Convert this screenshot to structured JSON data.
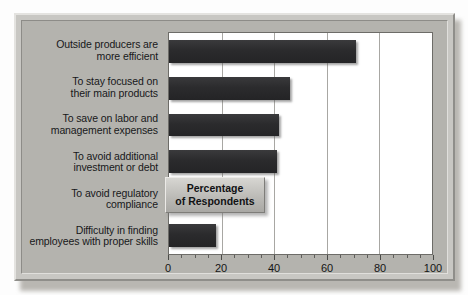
{
  "chart_data": {
    "type": "bar",
    "orientation": "horizontal",
    "title": "",
    "xlabel": "Percentage of Respondents",
    "ylabel": "",
    "xlim": [
      0,
      100
    ],
    "grid": true,
    "legend_position": "inside-right",
    "categories": [
      "Outside producers are more efficient",
      "To stay focused on their main products",
      "To save on labor and management expenses",
      "To avoid additional investment or debt",
      "To avoid regulatory compliance",
      "Difficulty in finding employees with proper skills"
    ],
    "values": [
      71,
      46,
      42,
      41,
      20,
      18
    ],
    "tick_labels": [
      "0",
      "20",
      "40",
      "60",
      "80",
      "100"
    ],
    "tick_values": [
      0,
      20,
      40,
      60,
      80,
      100
    ],
    "minor_tick_step": 5,
    "bar_color": "#2b2b2d",
    "plot_background": "#ffffff",
    "gridline_color": "#a8a7a3"
  },
  "categories_wrapped": [
    {
      "line1": "Outside producers are",
      "line2": "more efficient"
    },
    {
      "line1": "To stay focused on",
      "line2": "their main products"
    },
    {
      "line1": "To save on labor and",
      "line2": "management expenses"
    },
    {
      "line1": "To avoid additional",
      "line2": "investment or debt"
    },
    {
      "line1": "To avoid regulatory",
      "line2": "compliance"
    },
    {
      "line1": "Difficulty in finding",
      "line2": "employees with proper skills"
    }
  ],
  "legend": {
    "line1": "Percentage",
    "line2": "of Respondents"
  },
  "colors": {
    "frame": "#c8c7c3",
    "panel": "#b4b3ae",
    "bar": "#2b2b2d",
    "grid": "#a8a7a3",
    "text": "#17181a"
  }
}
